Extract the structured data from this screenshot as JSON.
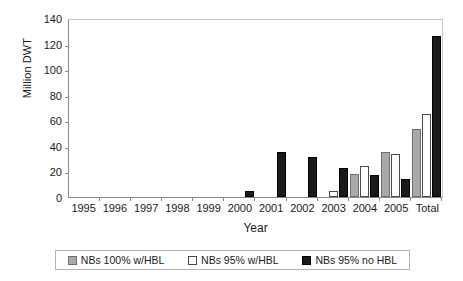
{
  "chart_data": {
    "type": "bar",
    "title": "",
    "xlabel": "Year",
    "ylabel": "Million DWT",
    "categories": [
      "1995",
      "1996",
      "1997",
      "1998",
      "1999",
      "2000",
      "2001",
      "2002",
      "2003",
      "2004",
      "2005",
      "Total"
    ],
    "series": [
      {
        "name": "NBs 100% w/HBL",
        "color": "#a9a9a9",
        "values": [
          0,
          0,
          0,
          0,
          0,
          0,
          0,
          0,
          0,
          18,
          35,
          53
        ]
      },
      {
        "name": "NBs 95% w/HBL",
        "color": "#ffffff",
        "values": [
          0,
          0,
          0,
          0,
          0,
          0,
          0,
          0,
          5,
          24,
          34,
          65
        ]
      },
      {
        "name": "NBs 95% no HBL",
        "color": "#1a1a1a",
        "values": [
          0,
          0,
          0,
          0,
          0,
          5,
          35,
          31,
          23,
          17,
          14,
          126
        ]
      }
    ],
    "ylim": [
      0,
      140
    ],
    "yticks": [
      0,
      20,
      40,
      60,
      80,
      100,
      120,
      140
    ],
    "grid": false,
    "legend_position": "bottom"
  }
}
